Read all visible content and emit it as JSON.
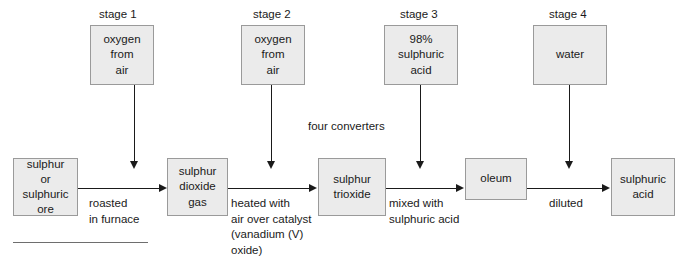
{
  "diagram": {
    "title_stages": [
      {
        "label": "stage 1"
      },
      {
        "label": "stage 2"
      },
      {
        "label": "stage 3"
      },
      {
        "label": "stage 4"
      }
    ],
    "top_boxes": [
      {
        "text": "oxygen\nfrom\nair"
      },
      {
        "text": "oxygen\nfrom\nair"
      },
      {
        "text": "98%\nsulphuric\nacid"
      },
      {
        "text": "water"
      }
    ],
    "main_boxes": [
      {
        "text": "sulphur\nor\nsulphuric\nore"
      },
      {
        "text": "sulphur\ndioxide\ngas"
      },
      {
        "text": "sulphur\ntrioxide"
      },
      {
        "text": "oleum"
      },
      {
        "text": "sulphuric\nacid"
      }
    ],
    "process_captions": [
      {
        "text": "roasted\nin furnace"
      },
      {
        "text": "heated with\nair over catalyst\n(vanadium (V)\noxide)"
      },
      {
        "text": "mixed with\nsulphuric acid"
      },
      {
        "text": "diluted"
      }
    ],
    "annotation": {
      "text": "four converters"
    },
    "colors": {
      "box_fill": "#ebebeb",
      "box_border": "#9a9a9a",
      "text": "#1a1a1a",
      "arrow": "#1a1a1a",
      "background": "#ffffff"
    }
  }
}
